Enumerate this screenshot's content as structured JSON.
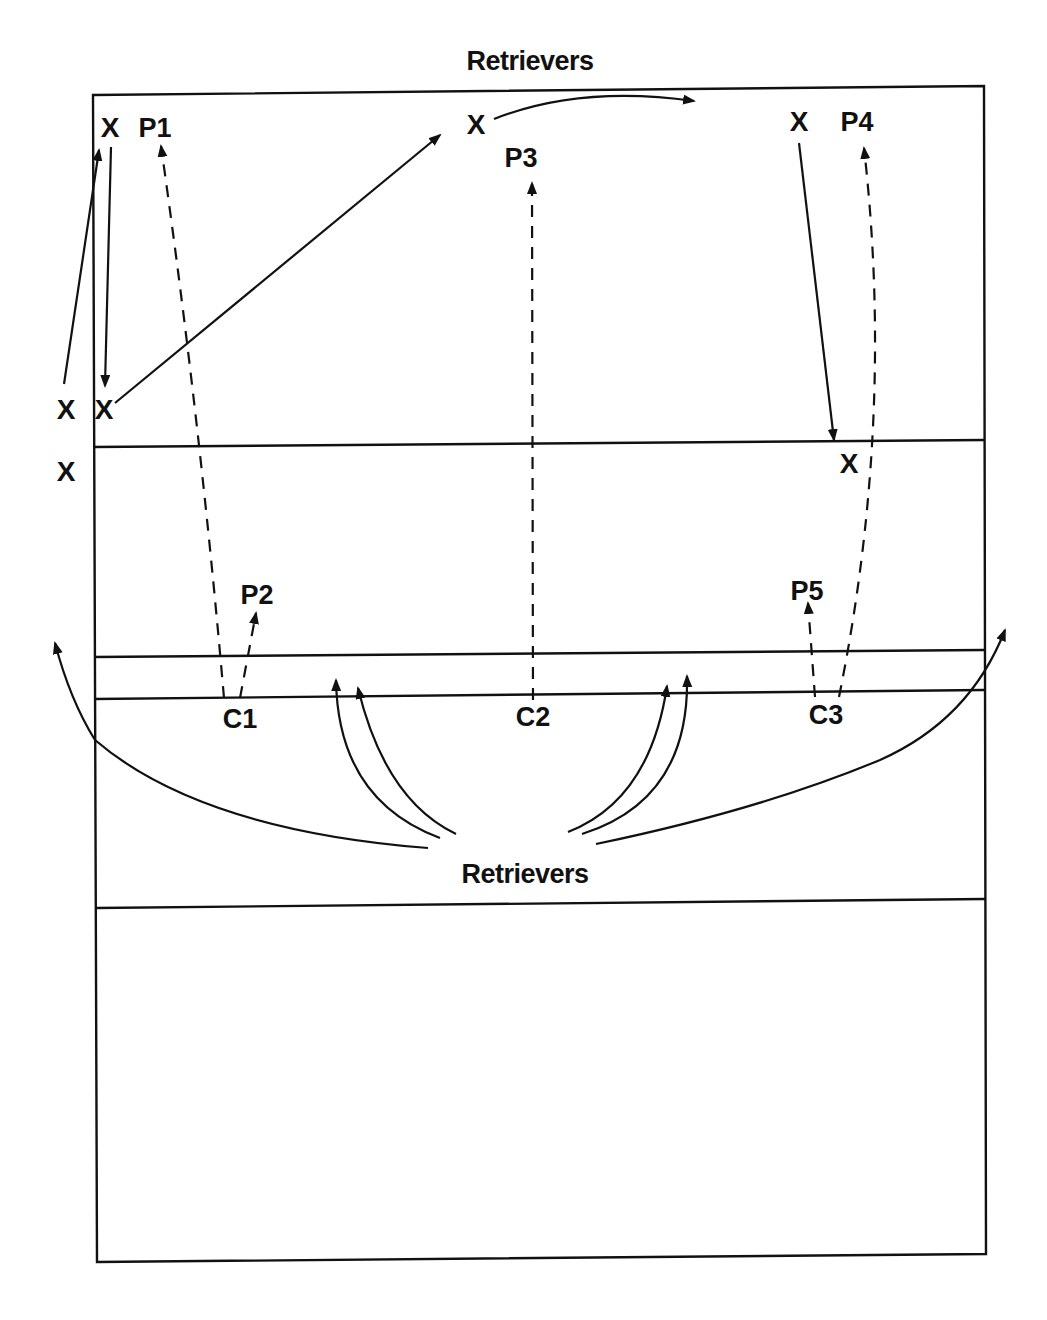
{
  "diagram": {
    "type": "volleyball-play-diagram",
    "top_label": "Retrievers",
    "bottom_label": "Retrievers",
    "colors": {
      "ink": "#111111",
      "background": "#ffffff"
    },
    "players": {
      "x_markers": [
        {
          "id": "x-top-left",
          "label": "X",
          "x": 110,
          "y": 127
        },
        {
          "id": "x-mid-left-outside",
          "label": "X",
          "x": 66,
          "y": 409
        },
        {
          "id": "x-mid-left-inside",
          "label": "X",
          "x": 104,
          "y": 409
        },
        {
          "id": "x-low-left-outside",
          "label": "X",
          "x": 66,
          "y": 471
        },
        {
          "id": "x-top-center",
          "label": "X",
          "x": 476,
          "y": 124
        },
        {
          "id": "x-top-right",
          "label": "X",
          "x": 799,
          "y": 121
        },
        {
          "id": "x-mid-right",
          "label": "X",
          "x": 849,
          "y": 463
        }
      ],
      "positions": [
        {
          "id": "P1",
          "label": "P1",
          "x": 155,
          "y": 127
        },
        {
          "id": "P2",
          "label": "P2",
          "x": 257,
          "y": 594
        },
        {
          "id": "P3",
          "label": "P3",
          "x": 521,
          "y": 157
        },
        {
          "id": "P4",
          "label": "P4",
          "x": 857,
          "y": 121
        },
        {
          "id": "P5",
          "label": "P5",
          "x": 807,
          "y": 590
        }
      ],
      "coverage": [
        {
          "id": "C1",
          "label": "C1",
          "x": 240,
          "y": 718
        },
        {
          "id": "C2",
          "label": "C2",
          "x": 533,
          "y": 716
        },
        {
          "id": "C3",
          "label": "C3",
          "x": 826,
          "y": 714
        }
      ]
    },
    "paths": {
      "solid_count": 11,
      "dashed_count": 5
    }
  }
}
